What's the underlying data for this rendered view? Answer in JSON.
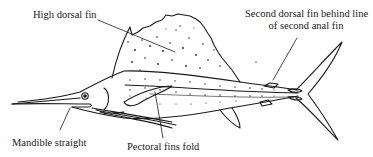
{
  "diagram": {
    "style": "black-and-white line drawing",
    "colors": {
      "line": "#1a1a1a",
      "background": "#ffffff"
    },
    "labels": [
      {
        "id": "high-dorsal-fin",
        "text": "High dorsal fin"
      },
      {
        "id": "second-dorsal-fin",
        "line1": "Second dorsal fin behind line",
        "line2": "of second anal fin"
      },
      {
        "id": "mandible",
        "text": "Mandible straight"
      },
      {
        "id": "pectoral",
        "text": "Pectoral fins fold"
      }
    ]
  }
}
